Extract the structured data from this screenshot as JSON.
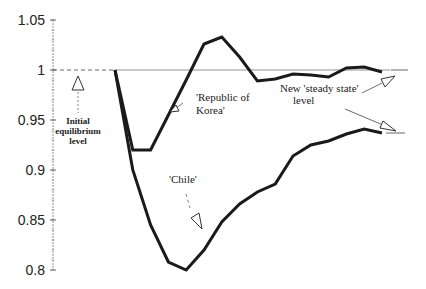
{
  "chart_data": {
    "type": "line",
    "title": "",
    "xlabel": "",
    "ylabel": "",
    "ylim": [
      0.8,
      1.05
    ],
    "yticks": [
      "1.05",
      "1",
      "0.95",
      "0.9",
      "0.85",
      "0.8"
    ],
    "ytick_values": [
      1.05,
      1.0,
      0.95,
      0.9,
      0.85,
      0.8
    ],
    "grid": false,
    "x": [
      0,
      1,
      2,
      3,
      4,
      5,
      6,
      7,
      8,
      9,
      10,
      11,
      12,
      13,
      14,
      15
    ],
    "series": [
      {
        "name": "'Republic of Korea'",
        "values": [
          1.0,
          0.92,
          0.92,
          0.955,
          0.99,
          1.026,
          1.033,
          1.013,
          0.989,
          0.991,
          0.996,
          0.995,
          0.993,
          1.002,
          1.003,
          0.998
        ]
      },
      {
        "name": "'Chile'",
        "values": [
          1.0,
          0.9,
          0.845,
          0.808,
          0.8,
          0.82,
          0.848,
          0.866,
          0.878,
          0.886,
          0.914,
          0.925,
          0.929,
          0.936,
          0.941,
          0.937
        ]
      }
    ],
    "reference_lines": [
      {
        "label": "Initial equilibrium level",
        "value": 1.0
      },
      {
        "label": "New 'steady state' level (Korea)",
        "value": 1.0
      },
      {
        "label": "New 'steady state' level (Chile)",
        "value": 0.937
      }
    ],
    "annotations": [
      {
        "text": "Initial equilibrium level",
        "lines": [
          "Initial",
          "equilibrium",
          "level"
        ]
      },
      {
        "text": "'Republic of Korea'",
        "lines": [
          "'Republic of",
          "Korea'"
        ]
      },
      {
        "text": "'Chile'",
        "lines": [
          "'Chile'"
        ]
      },
      {
        "text": "New 'steady state' level",
        "lines": [
          "New 'steady state'",
          "level"
        ]
      }
    ]
  },
  "labels": {
    "initial": [
      "Initial",
      "equilibrium",
      "level"
    ],
    "korea": [
      "'Republic of",
      "Korea'"
    ],
    "chile": "'Chile'",
    "steady": [
      "New 'steady state'",
      "level"
    ]
  }
}
